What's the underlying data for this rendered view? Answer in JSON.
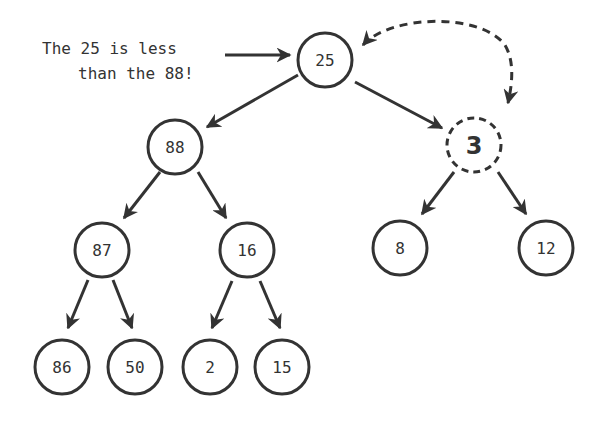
{
  "annotation": {
    "line1": "The 25 is less",
    "line2": "than the 88!"
  },
  "tree": {
    "nodes": [
      {
        "id": "n25",
        "label": "25",
        "style": "solid"
      },
      {
        "id": "n88",
        "label": "88",
        "style": "solid"
      },
      {
        "id": "n3",
        "label": "3",
        "style": "dashed"
      },
      {
        "id": "n87",
        "label": "87",
        "style": "solid"
      },
      {
        "id": "n16",
        "label": "16",
        "style": "solid"
      },
      {
        "id": "n8",
        "label": "8",
        "style": "solid"
      },
      {
        "id": "n12",
        "label": "12",
        "style": "solid"
      },
      {
        "id": "n86",
        "label": "86",
        "style": "solid"
      },
      {
        "id": "n50",
        "label": "50",
        "style": "solid"
      },
      {
        "id": "n2",
        "label": "2",
        "style": "solid"
      },
      {
        "id": "n15",
        "label": "15",
        "style": "solid"
      }
    ],
    "edges": [
      [
        "25",
        "88"
      ],
      [
        "25",
        "3"
      ],
      [
        "88",
        "87"
      ],
      [
        "88",
        "16"
      ],
      [
        "3",
        "8"
      ],
      [
        "3",
        "12"
      ],
      [
        "87",
        "86"
      ],
      [
        "87",
        "50"
      ],
      [
        "16",
        "2"
      ],
      [
        "16",
        "15"
      ]
    ],
    "swap": {
      "from": "3",
      "to": "25",
      "style": "dashed-bidirectional"
    }
  },
  "colors": {
    "stroke": "#333333",
    "background": "#ffffff"
  }
}
